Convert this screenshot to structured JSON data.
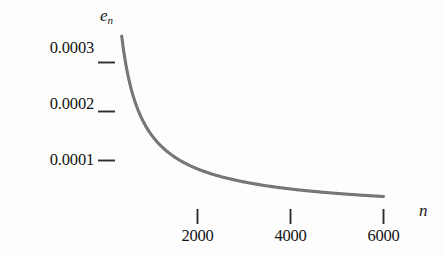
{
  "chart_data": {
    "type": "line",
    "title": "",
    "subtitle": "",
    "xlabel": "n",
    "ylabel": "e_n",
    "ylabel_base": "e",
    "ylabel_sub": "n",
    "xlabel_plain": "n",
    "grid": false,
    "legend": null,
    "xlim": [
      0,
      6600
    ],
    "ylim": [
      0,
      0.000375
    ],
    "xticks": [
      2000,
      4000,
      6000
    ],
    "xtick_labels": [
      "2000",
      "4000",
      "6000"
    ],
    "yticks": [
      0.0001,
      0.0002,
      0.0003
    ],
    "ytick_labels": [
      "0.0001",
      "0.0002",
      "0.0003"
    ],
    "series": [
      {
        "name": "e_n",
        "style": "solid-thick-gray",
        "color": "#6e6e6e",
        "x": [
          370,
          420,
          470,
          520,
          580,
          650,
          720,
          800,
          900,
          1000,
          1100,
          1250,
          1400,
          1600,
          1800,
          2000,
          2250,
          2500,
          2750,
          3000,
          3250,
          3500,
          3750,
          4000,
          4250,
          4500,
          4750,
          5000,
          5250,
          5500,
          5750,
          6000
        ],
        "y": [
          0.000322,
          0.000296,
          0.000274,
          0.000256,
          0.000238,
          0.00022,
          0.000205,
          0.00019,
          0.000175,
          0.000163,
          0.000154,
          0.000142,
          0.000132,
          0.00012,
          0.000112,
          6.79e-05,
          6.4e-05,
          6.08e-05,
          5.8e-05,
          5.56e-05,
          5.35e-05,
          5.16e-05,
          4.99e-05,
          4.46e-05,
          4.32e-05,
          4.2e-05,
          4.09e-05,
          3.99e-05,
          3.9e-05,
          3.81e-05,
          3.73e-05,
          2.86e-05
        ]
      }
    ]
  },
  "axes": {
    "x_axis_name": "horizontal-axis",
    "y_axis_name": "vertical-axis"
  }
}
